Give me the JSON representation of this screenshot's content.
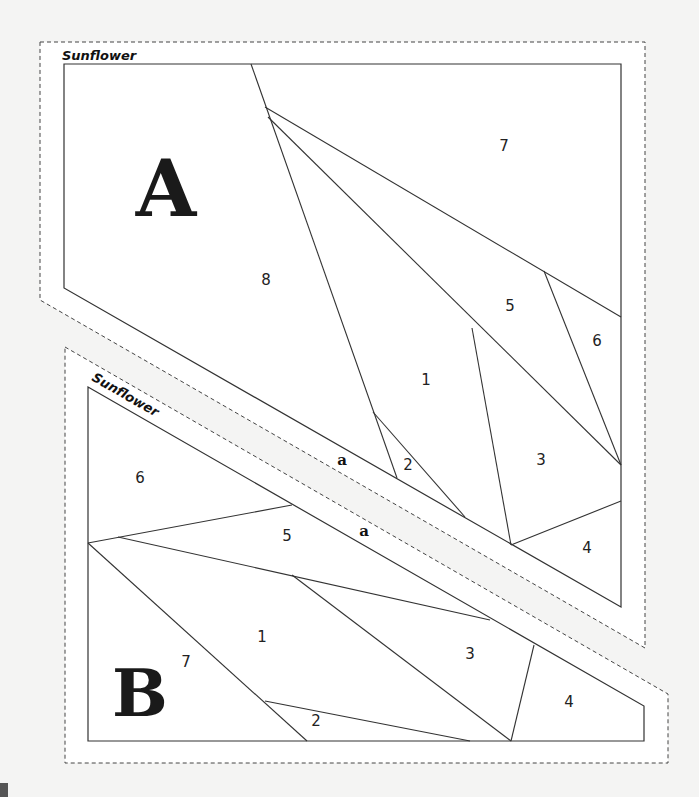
{
  "pattern": {
    "name": "Sunflower",
    "colors": {
      "background": "#f4f4f3",
      "paper": "#ffffff",
      "line": "#333333",
      "dash": "#444444"
    },
    "sections": [
      {
        "id": "A",
        "title": "Sunflower",
        "letter": "A",
        "seam_label": "a",
        "dashed_outline": "40,42 645,42 645,648 40,300",
        "outline": "64,64 621,64 621,607 64,288",
        "lines": [
          [
            251,
            64,
            397,
            478
          ],
          [
            265,
            107,
            621,
            317
          ],
          [
            268,
            117,
            621,
            465
          ],
          [
            373,
            412,
            465,
            517
          ],
          [
            544,
            271,
            621,
            465
          ],
          [
            472,
            328,
            511,
            545
          ],
          [
            511,
            545,
            621,
            501
          ]
        ],
        "pieces": [
          {
            "n": "1",
            "x": 426,
            "y": 385
          },
          {
            "n": "2",
            "x": 408,
            "y": 470
          },
          {
            "n": "3",
            "x": 541,
            "y": 465
          },
          {
            "n": "4",
            "x": 587,
            "y": 553
          },
          {
            "n": "5",
            "x": 510,
            "y": 311
          },
          {
            "n": "6",
            "x": 597,
            "y": 346
          },
          {
            "n": "7",
            "x": 504,
            "y": 151
          },
          {
            "n": "8",
            "x": 266,
            "y": 285
          }
        ],
        "letter_pos": {
          "x": 166,
          "y": 216,
          "size": 78
        },
        "seam_label_pos": {
          "x": 342,
          "y": 465
        },
        "title_pos": {
          "x": 62,
          "y": 60,
          "rotate": 0
        }
      },
      {
        "id": "B",
        "title": "Sunflower",
        "letter": "B",
        "seam_label": "a",
        "dashed_outline": "65,347 668,694 668,763 65,763",
        "outline": "88,387 644,706 644,741 88,741",
        "lines": [
          [
            88,
            543,
            292,
            505
          ],
          [
            118,
            537,
            490,
            620
          ],
          [
            88,
            543,
            307,
            741
          ],
          [
            265,
            701,
            470,
            741
          ],
          [
            292,
            575,
            511,
            741
          ],
          [
            534,
            645,
            511,
            741
          ]
        ],
        "pieces": [
          {
            "n": "1",
            "x": 262,
            "y": 642
          },
          {
            "n": "2",
            "x": 316,
            "y": 726
          },
          {
            "n": "3",
            "x": 470,
            "y": 659
          },
          {
            "n": "4",
            "x": 569,
            "y": 707
          },
          {
            "n": "5",
            "x": 287,
            "y": 541
          },
          {
            "n": "6",
            "x": 140,
            "y": 483
          },
          {
            "n": "7",
            "x": 186,
            "y": 667
          }
        ],
        "letter_pos": {
          "x": 140,
          "y": 716,
          "size": 66
        },
        "seam_label_pos": {
          "x": 364,
          "y": 536
        },
        "title_pos": {
          "x": 91,
          "y": 380,
          "rotate": 29.8
        }
      }
    ]
  }
}
